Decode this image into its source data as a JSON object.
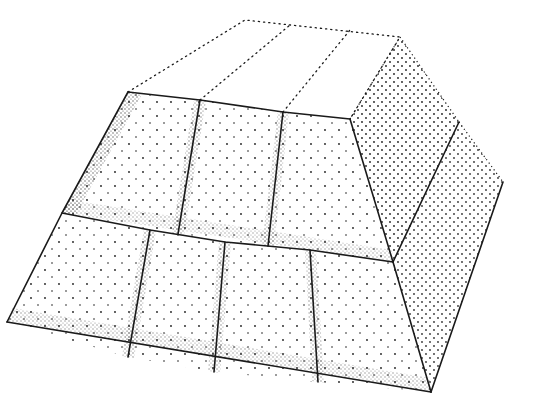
{
  "illustration": {
    "subject": "Stippled drawing of a stepped truncated pyramid built from rectangular stone blocks",
    "style": "black ink stipple on white",
    "ink_color": "#1a1a1a",
    "background_color": "#ffffff",
    "rows": [
      {
        "name": "upper-row",
        "block_count": 3
      },
      {
        "name": "lower-row",
        "block_count": 4
      }
    ]
  }
}
